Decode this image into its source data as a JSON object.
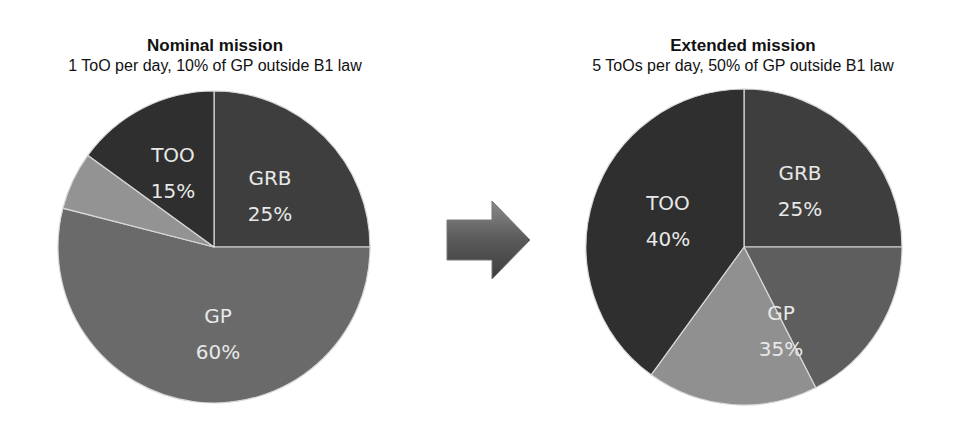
{
  "chart_data": [
    {
      "type": "pie",
      "title": "Nominal mission",
      "subtitle": "1 ToO per day, 10% of GP outside B1 law",
      "slices": [
        {
          "name": "GRB",
          "value": 25,
          "label": "GRB",
          "pct_label": "25%",
          "color": "#3e3e3e"
        },
        {
          "name": "GP (B1 law)",
          "value": 54,
          "label": "GP",
          "pct_label": "60%",
          "color": "#6a6a6a",
          "group": "GP"
        },
        {
          "name": "GP (outside B1 law)",
          "value": 6,
          "label": "",
          "pct_label": "",
          "color": "#939393",
          "group": "GP"
        },
        {
          "name": "TOO",
          "value": 15,
          "label": "TOO",
          "pct_label": "15%",
          "color": "#2f2f2f"
        }
      ],
      "groups": [
        {
          "name": "GP",
          "value": 60
        }
      ],
      "start_angle": "top",
      "direction": "clockwise"
    },
    {
      "type": "pie",
      "title": "Extended mission",
      "subtitle": "5 ToOs per day, 50% of GP outside B1 law",
      "slices": [
        {
          "name": "GRB",
          "value": 25,
          "label": "GRB",
          "pct_label": "25%",
          "color": "#3e3e3e"
        },
        {
          "name": "GP (B1 law)",
          "value": 17.5,
          "label": "",
          "pct_label": "",
          "color": "#5e5e5e",
          "group": "GP"
        },
        {
          "name": "GP (outside B1 law)",
          "value": 17.5,
          "label": "",
          "pct_label": "",
          "color": "#909090",
          "group": "GP"
        },
        {
          "name": "TOO",
          "value": 40,
          "label": "TOO",
          "pct_label": "40%",
          "color": "#2f2f2f"
        }
      ],
      "groups": [
        {
          "name": "GP",
          "value": 35,
          "label": "GP",
          "pct_label": "35%"
        }
      ],
      "start_angle": "top",
      "direction": "clockwise"
    }
  ],
  "arrow": {
    "icon": "right-arrow-icon",
    "color": "#555555"
  }
}
